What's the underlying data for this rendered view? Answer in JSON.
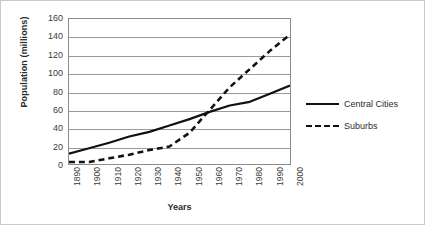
{
  "chart_data": {
    "type": "line",
    "title": "",
    "xlabel": "Years",
    "ylabel": "Population (millions)",
    "x": [
      1890,
      1900,
      1910,
      1920,
      1930,
      1940,
      1950,
      1960,
      1970,
      1980,
      1990,
      2000
    ],
    "xtick_labels": [
      "1890",
      "1900",
      "1910",
      "1920",
      "1930",
      "1940",
      "1950",
      "1960",
      "1970",
      "1980",
      "1990",
      "2000"
    ],
    "ytick_labels": [
      "0",
      "20",
      "40",
      "60",
      "80",
      "100",
      "120",
      "140",
      "160"
    ],
    "yticks": [
      0,
      20,
      40,
      60,
      80,
      100,
      120,
      140,
      160
    ],
    "ylim": [
      0,
      160
    ],
    "xlim": [
      1890,
      2000
    ],
    "grid": "horizontal",
    "legend_position": "right",
    "series": [
      {
        "name": "Central Cities",
        "style": "solid",
        "color": "#111111",
        "values": [
          12,
          18,
          24,
          31,
          36,
          43,
          50,
          58,
          65,
          69,
          78,
          87
        ]
      },
      {
        "name": "Suburbs",
        "style": "dashed",
        "color": "#111111",
        "values": [
          3,
          3,
          7,
          11,
          16,
          20,
          35,
          60,
          85,
          105,
          125,
          143
        ]
      }
    ]
  },
  "legend": {
    "items": [
      {
        "label": "Central Cities",
        "style": "solid"
      },
      {
        "label": "Suburbs",
        "style": "dashed"
      }
    ]
  },
  "colors": {
    "line": "#111111",
    "grid": "#9a9a9a",
    "axis": "#8d8d8d",
    "text": "#2b2b2b",
    "background": "#ffffff",
    "border": "#c9c9c9"
  }
}
